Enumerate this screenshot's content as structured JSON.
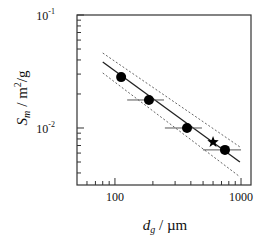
{
  "chart_data": {
    "type": "scatter",
    "title": "",
    "xlabel": "d_g / µm",
    "ylabel": "S_m / m²/g",
    "xscale": "log",
    "yscale": "log",
    "xlim": [
      50,
      1200
    ],
    "ylim": [
      0.00313,
      0.1
    ],
    "grid": false,
    "legend": null,
    "x_ticks": [
      {
        "value": 100,
        "label": "100"
      },
      {
        "value": 1000,
        "label": "1000"
      }
    ],
    "y_ticks": [
      {
        "value": 0.1,
        "label": "10",
        "exp": "-1"
      },
      {
        "value": 0.01,
        "label": "10",
        "exp": "-2"
      }
    ],
    "x_minor_ticks": [
      60,
      70,
      80,
      90,
      200,
      300,
      400,
      500,
      600,
      700,
      800,
      900
    ],
    "y_minor_ticks": [
      0.004,
      0.005,
      0.006,
      0.007,
      0.008,
      0.009,
      0.02,
      0.03,
      0.04,
      0.05,
      0.06,
      0.07,
      0.08,
      0.09
    ],
    "series": [
      {
        "name": "measured",
        "marker": "circle",
        "points": [
          {
            "x": 112,
            "y": 0.0282,
            "xerr": null
          },
          {
            "x": 186,
            "y": 0.0177,
            "xerr": [
              125,
              245
            ]
          },
          {
            "x": 373,
            "y": 0.01,
            "xerr": [
              249,
              490
            ]
          },
          {
            "x": 746,
            "y": 0.0064,
            "xerr": [
              499,
              1000
            ]
          }
        ]
      },
      {
        "name": "star point",
        "marker": "star",
        "points": [
          {
            "x": 600,
            "y": 0.0075
          }
        ]
      },
      {
        "name": "fit",
        "style": "solid",
        "points": [
          {
            "x": 80,
            "y": 0.0384
          },
          {
            "x": 980,
            "y": 0.005
          }
        ]
      },
      {
        "name": "upper bound",
        "style": "dashed",
        "points": [
          {
            "x": 80,
            "y": 0.0461
          },
          {
            "x": 980,
            "y": 0.0068
          }
        ]
      },
      {
        "name": "lower bound",
        "style": "dashed",
        "points": [
          {
            "x": 80,
            "y": 0.0307
          },
          {
            "x": 980,
            "y": 0.0037
          }
        ]
      }
    ]
  },
  "labels": {
    "x_axis": {
      "main": "d",
      "sub": "g",
      "unit": " / µm"
    },
    "y_axis": {
      "main": "S",
      "sub": "m",
      "unit_pre": "/  m",
      "sup": "2",
      "unit_post": "/g"
    }
  }
}
